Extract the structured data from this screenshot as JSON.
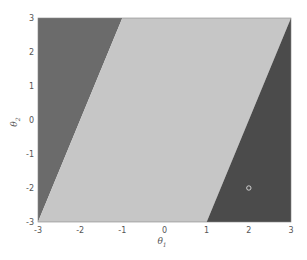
{
  "chart_data": {
    "type": "area",
    "title": "",
    "xlabel": "θ1",
    "ylabel": "θ2",
    "xlim": [
      -3,
      3
    ],
    "ylim": [
      -3,
      3
    ],
    "grid": false,
    "x_ticks": [
      "-3",
      "-2",
      "-1",
      "0",
      "1",
      "2",
      "3"
    ],
    "y_ticks": [
      "-3",
      "-2",
      "-1",
      "0",
      "1",
      "2",
      "3"
    ],
    "regions": [
      {
        "name": "left-region",
        "color": "#6b6b6b",
        "polygon": [
          [
            -3,
            -3
          ],
          [
            -1,
            3
          ],
          [
            -3,
            3
          ]
        ]
      },
      {
        "name": "middle-region",
        "color": "#c6c6c6",
        "polygon": [
          [
            -3,
            -3
          ],
          [
            1,
            -3
          ],
          [
            3,
            3
          ],
          [
            -1,
            3
          ]
        ]
      },
      {
        "name": "right-region",
        "color": "#4b4b4b",
        "polygon": [
          [
            1,
            -3
          ],
          [
            3,
            -3
          ],
          [
            3,
            3
          ]
        ]
      }
    ],
    "markers": [
      {
        "x": 2,
        "y": -2,
        "shape": "circle-open",
        "color": "#dddddd"
      }
    ]
  },
  "labels": {
    "xlabel_main": "θ",
    "xlabel_sub": "1",
    "ylabel_main": "θ",
    "ylabel_sub": "2"
  }
}
